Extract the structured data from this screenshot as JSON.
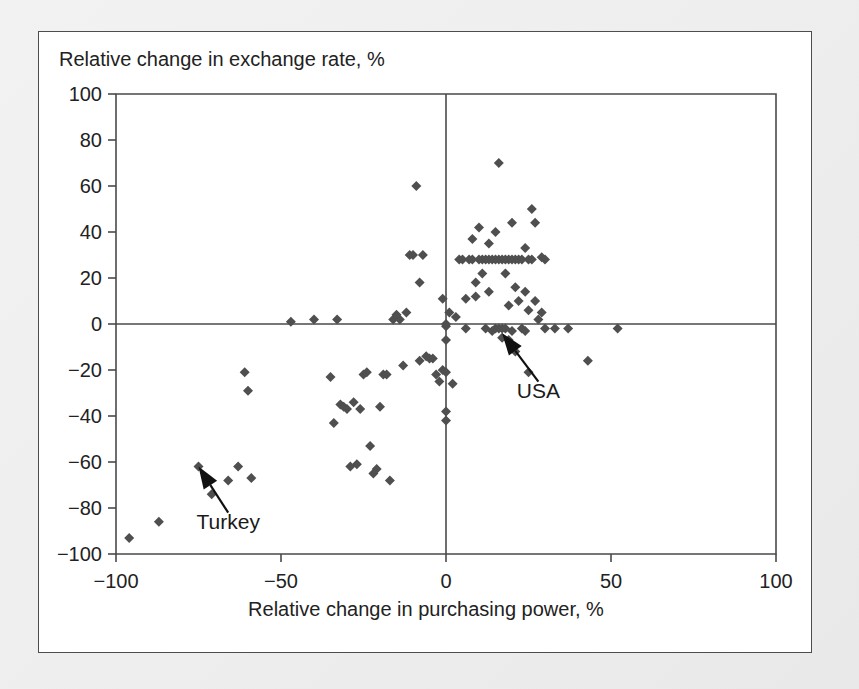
{
  "figure": {
    "background_color": "#ffffff",
    "page_background_color": "#efefef",
    "frame_color": "#4d4d4d",
    "marker_color": "#4f4f4f",
    "axis_color": "#4a4a4a"
  },
  "chart_data": {
    "type": "scatter",
    "title": "",
    "ylabel": "Relative change in exchange rate, %",
    "xlabel": "Relative change in purchasing power, %",
    "xlim": [
      -100,
      100
    ],
    "ylim": [
      -100,
      100
    ],
    "xticks": [
      -100,
      -50,
      0,
      50,
      100
    ],
    "yticks": [
      -100,
      -80,
      -60,
      -40,
      -20,
      0,
      20,
      40,
      60,
      80,
      100
    ],
    "xticklabels": [
      "−100",
      "−50",
      "0",
      "50",
      "100"
    ],
    "yticklabels": [
      "−100",
      "−80",
      "−60",
      "−40",
      "−20",
      "0",
      "20",
      "40",
      "60",
      "80",
      "100"
    ],
    "grid": false,
    "legend": null,
    "zero_lines": {
      "x": 0,
      "y": 0
    },
    "marker_shape": "diamond",
    "points": [
      [
        -96,
        -93
      ],
      [
        -87,
        -86
      ],
      [
        -75,
        -62
      ],
      [
        -71,
        -74
      ],
      [
        -66,
        -68
      ],
      [
        -63,
        -62
      ],
      [
        -61,
        -21
      ],
      [
        -60,
        -29
      ],
      [
        -59,
        -67
      ],
      [
        -47,
        1
      ],
      [
        -40,
        2
      ],
      [
        -35,
        -23
      ],
      [
        -34,
        -43
      ],
      [
        -33,
        2
      ],
      [
        -32,
        -35
      ],
      [
        -31,
        -36
      ],
      [
        -30,
        -37
      ],
      [
        -29,
        -62
      ],
      [
        -28,
        -34
      ],
      [
        -27,
        -61
      ],
      [
        -26,
        -37
      ],
      [
        -25,
        -22
      ],
      [
        -24,
        -21
      ],
      [
        -23,
        -53
      ],
      [
        -22,
        -65
      ],
      [
        -21,
        -63
      ],
      [
        -20,
        -36
      ],
      [
        -19,
        -22
      ],
      [
        -18,
        -22
      ],
      [
        -17,
        -68
      ],
      [
        -16,
        2
      ],
      [
        -15,
        4
      ],
      [
        -14,
        2
      ],
      [
        -13,
        -18
      ],
      [
        -12,
        5
      ],
      [
        -11,
        30
      ],
      [
        -10,
        30
      ],
      [
        -9,
        60
      ],
      [
        -8,
        18
      ],
      [
        -8,
        -16
      ],
      [
        -7,
        30
      ],
      [
        -6,
        -14
      ],
      [
        -5,
        -15
      ],
      [
        -4,
        -15
      ],
      [
        -3,
        -22
      ],
      [
        -2,
        -25
      ],
      [
        -1,
        11
      ],
      [
        -1,
        -20
      ],
      [
        0,
        0
      ],
      [
        0,
        -1
      ],
      [
        0,
        -7
      ],
      [
        0,
        -21
      ],
      [
        0,
        -38
      ],
      [
        0,
        -42
      ],
      [
        1,
        5
      ],
      [
        2,
        -26
      ],
      [
        3,
        3
      ],
      [
        4,
        28
      ],
      [
        5,
        28
      ],
      [
        6,
        11
      ],
      [
        6,
        -2
      ],
      [
        7,
        28
      ],
      [
        8,
        28
      ],
      [
        8,
        37
      ],
      [
        9,
        18
      ],
      [
        9,
        12
      ],
      [
        10,
        28
      ],
      [
        10,
        42
      ],
      [
        11,
        28
      ],
      [
        11,
        22
      ],
      [
        12,
        28
      ],
      [
        12,
        -2
      ],
      [
        13,
        28
      ],
      [
        13,
        35
      ],
      [
        13,
        14
      ],
      [
        14,
        28
      ],
      [
        14,
        -3
      ],
      [
        15,
        28
      ],
      [
        15,
        40
      ],
      [
        15,
        -2
      ],
      [
        16,
        70
      ],
      [
        16,
        28
      ],
      [
        16,
        -2
      ],
      [
        17,
        28
      ],
      [
        17,
        -2
      ],
      [
        17,
        -6
      ],
      [
        18,
        28
      ],
      [
        18,
        22
      ],
      [
        18,
        -2
      ],
      [
        19,
        28
      ],
      [
        19,
        8
      ],
      [
        19,
        -7
      ],
      [
        20,
        28
      ],
      [
        20,
        44
      ],
      [
        20,
        -3
      ],
      [
        21,
        28
      ],
      [
        21,
        16
      ],
      [
        21,
        -12
      ],
      [
        22,
        28
      ],
      [
        22,
        10
      ],
      [
        23,
        28
      ],
      [
        23,
        -2
      ],
      [
        24,
        33
      ],
      [
        24,
        14
      ],
      [
        24,
        -3
      ],
      [
        25,
        28
      ],
      [
        25,
        6
      ],
      [
        25,
        -21
      ],
      [
        26,
        50
      ],
      [
        26,
        28
      ],
      [
        27,
        44
      ],
      [
        27,
        10
      ],
      [
        28,
        2
      ],
      [
        29,
        29
      ],
      [
        29,
        5
      ],
      [
        30,
        28
      ],
      [
        30,
        -2
      ],
      [
        33,
        -2
      ],
      [
        37,
        -2
      ],
      [
        43,
        -16
      ],
      [
        52,
        -2
      ]
    ]
  },
  "annotations": [
    {
      "name": "turkey",
      "label": "Turkey",
      "point": [
        -75,
        -62
      ],
      "text_position": [
        -66,
        -89
      ]
    },
    {
      "name": "usa",
      "label": "USA",
      "point": [
        17,
        -4
      ],
      "text_position": [
        28,
        -32
      ]
    }
  ]
}
